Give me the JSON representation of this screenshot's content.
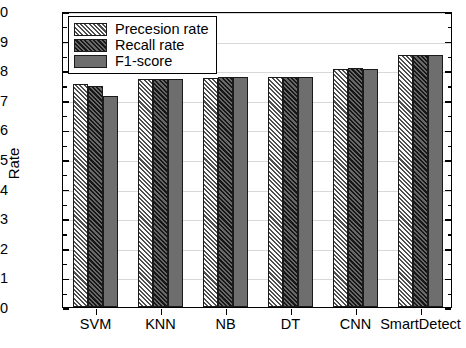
{
  "chart_data": {
    "type": "bar",
    "title": "",
    "xlabel": "",
    "ylabel": "Rate",
    "ylim": [
      0.0,
      1.0
    ],
    "ytick_step": 0.1,
    "grid": true,
    "legend_position": "top-left",
    "categories": [
      "SVM",
      "KNN",
      "NB",
      "DT",
      "CNN",
      "SmartDetect"
    ],
    "ytick_labels": [
      "0.0",
      "0.1",
      "0.2",
      "0.3",
      "0.4",
      "0.5",
      "0.6",
      "0.7",
      "0.8",
      "0.9",
      "1.0"
    ],
    "series": [
      {
        "name": "Precesion rate",
        "color": "#b4b4b4",
        "pattern": "diagonal-hatch",
        "values": [
          0.755,
          0.772,
          0.775,
          0.777,
          0.805,
          0.852
        ]
      },
      {
        "name": "Recall rate",
        "color": "#2e2e2e",
        "pattern": "diagonal-hatch-dark",
        "values": [
          0.745,
          0.771,
          0.777,
          0.778,
          0.806,
          0.852
        ]
      },
      {
        "name": "F1-score",
        "color": "#6e6e6e",
        "pattern": "solid",
        "values": [
          0.712,
          0.772,
          0.777,
          0.778,
          0.804,
          0.852
        ]
      }
    ]
  }
}
